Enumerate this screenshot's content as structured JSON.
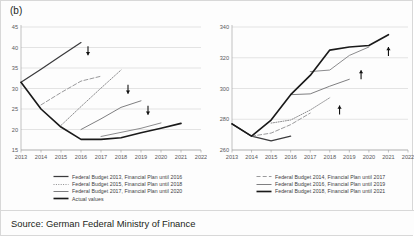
{
  "figure": {
    "panel_label": "(b)",
    "source": "Source: German Federal Ministry of Finance"
  },
  "legend_left": [
    {
      "label": "Federal Budget 2013, Financial Plan until 2016",
      "style": "solid-dark",
      "color": "#3b3b3d"
    },
    {
      "label": "Federal Budget 2015, Financial Plan until 2018",
      "style": "dotted",
      "color": "#8c8c8e"
    },
    {
      "label": "Federal Budget 2017, Financial Plan until 2020",
      "style": "solid-gray",
      "color": "#7f7f81"
    },
    {
      "label": "Actual values",
      "style": "solid-black",
      "color": "#1a1a1a"
    }
  ],
  "legend_right": [
    {
      "label": "Federal Budget 2014, Financial Plan until 2017",
      "style": "dashed",
      "color": "#9a9a9c"
    },
    {
      "label": "Federal Budget 2016, Financial Plan until 2019",
      "style": "solid-gray",
      "color": "#7f7f81"
    },
    {
      "label": "Federal Budget 2018, Financial Plan until 2021",
      "style": "solid-black",
      "color": "#1a1a1a"
    }
  ],
  "chart_data": [
    {
      "type": "line",
      "id": "left",
      "title": "",
      "xlabel": "",
      "ylabel": "",
      "x": [
        2013,
        2014,
        2015,
        2016,
        2017,
        2018,
        2019,
        2020,
        2021,
        2022
      ],
      "xlim": [
        2013,
        2022
      ],
      "ylim": [
        15,
        45
      ],
      "yticks": [
        15,
        20,
        25,
        30,
        35,
        40,
        45
      ],
      "xticks": [
        "2013",
        "2014",
        "2015",
        "2016",
        "2017",
        "2018",
        "2019",
        "2020",
        "2021",
        "2022"
      ],
      "grid": true,
      "legend_position": "below",
      "annotations": [
        {
          "text": "down-arrow",
          "x": 2016.35,
          "y": 39.2
        },
        {
          "text": "down-arrow",
          "x": 2018.35,
          "y": 29.8
        },
        {
          "text": "down-arrow",
          "x": 2019.35,
          "y": 24.7
        }
      ],
      "series": [
        {
          "name": "Federal Budget 2013, Financial Plan until 2016",
          "style": "solid-dark",
          "color": "#3b3b3d",
          "x": [
            2013,
            2014,
            2015,
            2016
          ],
          "values": [
            31.5,
            34.7,
            38.0,
            41.2
          ]
        },
        {
          "name": "Federal Budget 2014, Financial Plan until 2017",
          "style": "dashed",
          "color": "#9a9a9c",
          "x": [
            2014,
            2015,
            2016,
            2017
          ],
          "values": [
            26.0,
            29.0,
            31.8,
            33.0
          ]
        },
        {
          "name": "Federal Budget 2015, Financial Plan until 2018",
          "style": "dotted",
          "color": "#8c8c8e",
          "x": [
            2015,
            2016,
            2017,
            2018
          ],
          "values": [
            21.0,
            25.6,
            30.1,
            34.5
          ]
        },
        {
          "name": "Federal Budget 2016, Financial Plan until 2019",
          "style": "solid-gray",
          "color": "#7f7f81",
          "x": [
            2016,
            2017,
            2018,
            2019
          ],
          "values": [
            20.0,
            22.6,
            25.4,
            27.0
          ]
        },
        {
          "name": "Federal Budget 2017, Financial Plan until 2020",
          "style": "solid-gray",
          "color": "#8c8c8e",
          "x": [
            2017,
            2018,
            2019,
            2020
          ],
          "values": [
            18.3,
            19.3,
            20.3,
            21.6
          ]
        },
        {
          "name": "Actual values",
          "style": "solid-black",
          "color": "#1a1a1a",
          "x": [
            2013,
            2014,
            2015,
            2016,
            2017,
            2018,
            2019,
            2020,
            2021
          ],
          "values": [
            31.5,
            25.0,
            20.6,
            17.6,
            17.6,
            18.0,
            19.2,
            20.3,
            21.5
          ]
        }
      ]
    },
    {
      "type": "line",
      "id": "right",
      "title": "",
      "xlabel": "",
      "ylabel": "",
      "x": [
        2013,
        2014,
        2015,
        2016,
        2017,
        2018,
        2019,
        2020,
        2021,
        2022
      ],
      "xlim": [
        2013,
        2022
      ],
      "ylim": [
        260,
        340
      ],
      "yticks": [
        260,
        280,
        300,
        320,
        340
      ],
      "xticks": [
        "2013",
        "2014",
        "2015",
        "2016",
        "2017",
        "2018",
        "2019",
        "2020",
        "2021",
        "2022"
      ],
      "grid": true,
      "legend_position": "below",
      "annotations": [
        {
          "text": "up-arrow",
          "x": 2018.5,
          "y": 286.0
        },
        {
          "text": "up-arrow",
          "x": 2019.6,
          "y": 309.0
        },
        {
          "text": "up-arrow",
          "x": 2021.0,
          "y": 324.0
        }
      ],
      "series": [
        {
          "name": "Federal Budget 2013, Financial Plan until 2016",
          "style": "solid-dark",
          "color": "#3b3b3d",
          "x": [
            2013,
            2014,
            2015,
            2016
          ],
          "values": [
            277.0,
            269.0,
            266.0,
            269.0
          ]
        },
        {
          "name": "Federal Budget 2014, Financial Plan until 2017",
          "style": "dashed",
          "color": "#9a9a9c",
          "x": [
            2014,
            2015,
            2016,
            2017
          ],
          "values": [
            269.0,
            271.0,
            276.5,
            284.0
          ]
        },
        {
          "name": "Federal Budget 2015, Financial Plan until 2018",
          "style": "dotted",
          "color": "#8c8c8e",
          "x": [
            2015,
            2016,
            2017,
            2018
          ],
          "values": [
            277.5,
            279.5,
            286.0,
            294.0
          ]
        },
        {
          "name": "Federal Budget 2016, Financial Plan until 2019",
          "style": "solid-gray",
          "color": "#7f7f81",
          "x": [
            2016,
            2017,
            2018,
            2019
          ],
          "values": [
            296.0,
            296.5,
            301.5,
            306.0
          ]
        },
        {
          "name": "Federal Budget 2017, Financial Plan until 2020",
          "style": "solid-gray",
          "color": "#8c8c8e",
          "x": [
            2017,
            2018,
            2019,
            2020
          ],
          "values": [
            311.0,
            312.0,
            321.5,
            327.0
          ]
        },
        {
          "name": "Actual values",
          "style": "solid-black",
          "color": "#1a1a1a",
          "x": [
            2013,
            2014,
            2015,
            2016,
            2017,
            2018,
            2019,
            2020,
            2021
          ],
          "values": [
            277.0,
            269.0,
            279.5,
            296.0,
            308.5,
            325.0,
            327.0,
            328.0,
            335.0
          ]
        }
      ]
    }
  ]
}
